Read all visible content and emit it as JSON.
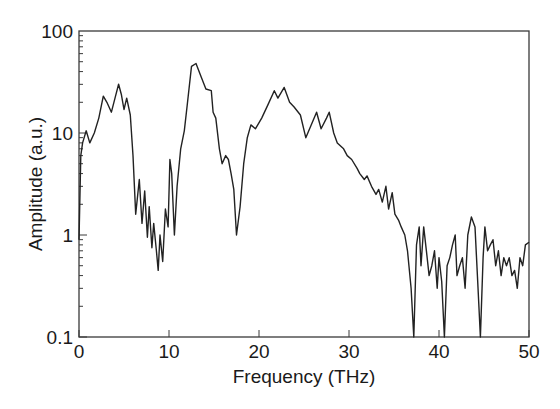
{
  "chart_data": {
    "type": "line",
    "title": "",
    "xlabel": "Frequency (THz)",
    "ylabel": "Amplitude (a.u.)",
    "xlim": [
      0,
      50
    ],
    "ylim": [
      0.1,
      100
    ],
    "yscale": "log",
    "grid": false,
    "legend": null,
    "x_ticks": [
      0,
      10,
      20,
      30,
      40,
      50
    ],
    "x_tick_labels": [
      "0",
      "10",
      "20",
      "30",
      "40",
      "50"
    ],
    "y_ticks": [
      0.1,
      1,
      10,
      100
    ],
    "y_tick_labels": [
      "0.1",
      "1",
      "10",
      "100"
    ],
    "series": [
      {
        "name": "Amplitude spectrum",
        "color": "#222222",
        "x": [
          0.0,
          0.2,
          0.4,
          0.8,
          1.2,
          1.7,
          2.2,
          2.7,
          3.1,
          3.6,
          4.0,
          4.4,
          4.7,
          5.0,
          5.3,
          5.7,
          6.0,
          6.3,
          6.7,
          7.0,
          7.3,
          7.6,
          7.8,
          8.1,
          8.3,
          8.6,
          8.8,
          9.0,
          9.3,
          9.6,
          9.9,
          10.1,
          10.3,
          10.6,
          10.9,
          11.3,
          11.7,
          12.0,
          12.5,
          13.0,
          13.6,
          14.1,
          14.7,
          14.9,
          15.2,
          15.6,
          15.9,
          16.3,
          16.6,
          16.9,
          17.2,
          17.5,
          17.9,
          18.3,
          18.7,
          19.1,
          19.6,
          20.3,
          21.0,
          21.7,
          22.1,
          22.8,
          23.4,
          23.9,
          24.6,
          25.2,
          25.8,
          26.4,
          26.9,
          27.5,
          27.8,
          28.3,
          28.7,
          29.4,
          29.8,
          30.3,
          30.9,
          31.2,
          31.7,
          32.0,
          32.5,
          33.0,
          33.3,
          33.7,
          34.1,
          34.4,
          34.8,
          35.1,
          35.5,
          35.8,
          36.2,
          36.5,
          36.9,
          37.2,
          37.5,
          37.8,
          38.0,
          38.3,
          38.6,
          38.9,
          39.2,
          39.5,
          39.8,
          40.0,
          40.3,
          40.6,
          40.9,
          41.2,
          41.5,
          41.8,
          42.0,
          42.3,
          42.6,
          42.9,
          43.2,
          43.6,
          44.0,
          44.3,
          44.6,
          44.9,
          45.1,
          45.4,
          45.7,
          46.0,
          46.3,
          46.6,
          46.9,
          47.2,
          47.5,
          47.8,
          48.1,
          48.4,
          48.7,
          49.0,
          49.3,
          49.6,
          50.0
        ],
        "y": [
          0.9,
          6.0,
          8.0,
          10.5,
          8.0,
          10.0,
          14.0,
          23.0,
          20.0,
          16.0,
          22.0,
          30.0,
          24.0,
          17.0,
          22.0,
          15.0,
          6.0,
          1.6,
          3.5,
          1.3,
          2.7,
          0.95,
          1.9,
          0.75,
          1.3,
          0.7,
          0.45,
          1.0,
          0.55,
          1.8,
          1.2,
          5.5,
          4.0,
          1.0,
          3.0,
          7.0,
          10.5,
          18.0,
          45.0,
          48.0,
          35.0,
          27.0,
          26.0,
          16.0,
          14.0,
          7.0,
          5.0,
          6.0,
          5.5,
          4.0,
          2.8,
          1.0,
          1.9,
          5.0,
          9.0,
          12.0,
          11.0,
          14.0,
          19.0,
          26.0,
          22.0,
          28.0,
          20.0,
          18.0,
          15.0,
          9.0,
          12.0,
          16.0,
          11.0,
          14.0,
          16.0,
          10.0,
          8.0,
          7.0,
          6.0,
          5.5,
          4.5,
          4.0,
          3.5,
          3.8,
          3.0,
          2.5,
          2.8,
          2.1,
          3.0,
          1.8,
          2.6,
          1.6,
          1.4,
          1.2,
          1.0,
          0.7,
          0.3,
          0.1,
          0.8,
          1.2,
          0.5,
          1.2,
          0.7,
          0.4,
          0.5,
          0.7,
          0.3,
          0.6,
          0.35,
          0.1,
          0.5,
          0.6,
          0.8,
          1.0,
          0.4,
          0.5,
          0.6,
          0.3,
          1.0,
          1.5,
          1.2,
          0.35,
          0.1,
          0.6,
          1.2,
          0.7,
          0.8,
          0.9,
          0.5,
          0.7,
          0.4,
          0.6,
          0.5,
          0.6,
          0.4,
          0.45,
          0.3,
          0.6,
          0.5,
          0.8,
          0.85
        ]
      }
    ]
  },
  "axes": {
    "x_label": "Frequency (THz)",
    "y_label": "Amplitude (a.u.)",
    "x_tick_labels": [
      "0",
      "10",
      "20",
      "30",
      "40",
      "50"
    ],
    "y_tick_labels": [
      "100",
      "10",
      "1",
      "0.1"
    ]
  }
}
